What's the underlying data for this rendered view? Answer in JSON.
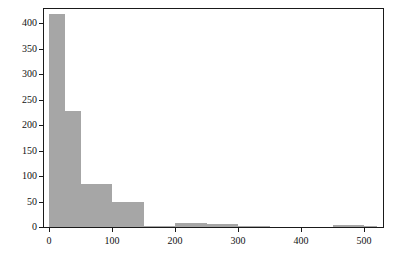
{
  "chart_data": {
    "type": "bar",
    "title": "",
    "subtitle": "",
    "xlabel": "",
    "ylabel": "",
    "grid": false,
    "legend": null,
    "xlim": [
      -8,
      530
    ],
    "ylim": [
      0,
      428
    ],
    "xticks": [
      0,
      100,
      200,
      300,
      400,
      500
    ],
    "xtick_labels": [
      "0",
      "100",
      "200",
      "300",
      "400",
      "500"
    ],
    "yticks": [
      0,
      50,
      100,
      150,
      200,
      250,
      300,
      350,
      400
    ],
    "ytick_labels": [
      "0",
      "50",
      "100",
      "150",
      "200",
      "250",
      "300",
      "350",
      "400"
    ],
    "bar_color": "#a6a6a6",
    "bins": [
      {
        "start": 0,
        "end": 25,
        "value": 418
      },
      {
        "start": 25,
        "end": 50,
        "value": 228
      },
      {
        "start": 50,
        "end": 75,
        "value": 85
      },
      {
        "start": 75,
        "end": 100,
        "value": 85
      },
      {
        "start": 100,
        "end": 150,
        "value": 50
      },
      {
        "start": 150,
        "end": 200,
        "value": 2
      },
      {
        "start": 200,
        "end": 250,
        "value": 8
      },
      {
        "start": 250,
        "end": 300,
        "value": 5
      },
      {
        "start": 300,
        "end": 350,
        "value": 1
      },
      {
        "start": 350,
        "end": 400,
        "value": 0
      },
      {
        "start": 400,
        "end": 450,
        "value": 0
      },
      {
        "start": 450,
        "end": 500,
        "value": 4
      },
      {
        "start": 500,
        "end": 520,
        "value": 1
      }
    ]
  }
}
